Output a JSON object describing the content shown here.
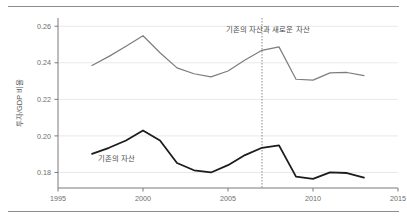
{
  "chart_data": {
    "type": "line",
    "title": "",
    "xlabel": "",
    "ylabel": "투자/GDP 비율",
    "xlim": [
      1995,
      2015
    ],
    "ylim": [
      0.1715,
      0.2645
    ],
    "grid": true,
    "legend_position": "inline-annotations",
    "xticks": [
      1995,
      2000,
      2005,
      2010,
      2015
    ],
    "xtick_labels": [
      "1995",
      "2000",
      "2005",
      "2010",
      "2015"
    ],
    "yticks": [
      0.18,
      0.2,
      0.22,
      0.24,
      0.26
    ],
    "ytick_labels": [
      "0.18",
      "0.20",
      "0.22",
      "0.24",
      "0.26"
    ],
    "x": [
      1997,
      1998,
      1999,
      2000,
      2001,
      2002,
      2003,
      2004,
      2005,
      2006,
      2007,
      2008,
      2009,
      2010,
      2011,
      2012,
      2013
    ],
    "series": [
      {
        "name": "기존의 자산과 새로운 자산",
        "color": "#7d7d7d",
        "width": 1.2,
        "values": [
          0.2385,
          0.2435,
          0.249,
          0.2548,
          0.2455,
          0.2372,
          0.234,
          0.2323,
          0.2355,
          0.2415,
          0.2468,
          0.2487,
          0.231,
          0.2305,
          0.2345,
          0.2347,
          0.233
        ]
      },
      {
        "name": "기존의 자산",
        "color": "#1c1c1c",
        "width": 1.8,
        "values": [
          0.1902,
          0.1935,
          0.1975,
          0.203,
          0.1975,
          0.1852,
          0.1812,
          0.18,
          0.184,
          0.1895,
          0.1935,
          0.1948,
          0.1777,
          0.1765,
          0.18,
          0.1797,
          0.1772
        ]
      }
    ],
    "annotations": [
      {
        "id": "upper-series-label",
        "text": "기존의 자산과 새로운 자산",
        "x": 2007.35,
        "y": 0.2568
      },
      {
        "id": "lower-series-label",
        "text": "기존의 자산",
        "x": 1998.45,
        "y": 0.1862
      }
    ],
    "vline": {
      "id": "structural-break-2007",
      "x": 2007,
      "style": "dotted",
      "color": "#8a8a8a"
    }
  }
}
